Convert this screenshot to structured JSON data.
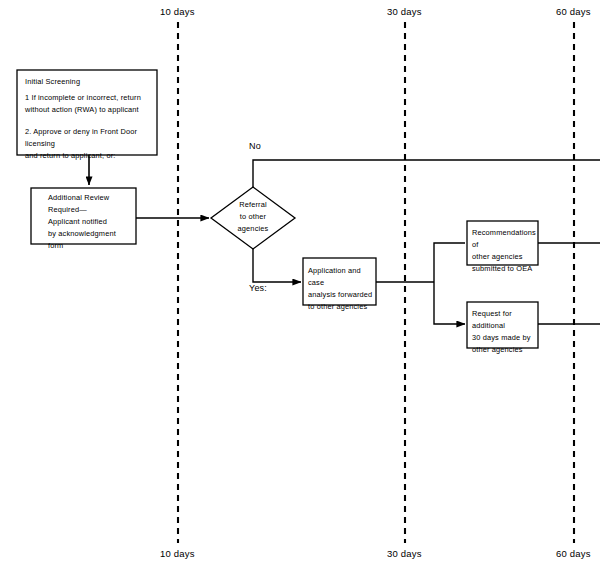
{
  "diagram": {
    "line_color": "#000000",
    "background_color": "#ffffff"
  },
  "timeline": {
    "markers": [
      {
        "label_top": "10 days",
        "label_bottom": "10 days",
        "x": 178
      },
      {
        "label_top": "30 days",
        "label_bottom": "30 days",
        "x": 405
      },
      {
        "label_top": "60 days",
        "label_bottom": "60 days",
        "x": 574
      }
    ]
  },
  "nodes": {
    "initial_screening": {
      "heading": "Initial Screening",
      "item_1": "1  If incomplete or incorrect, return\nwithout action (RWA) to applicant",
      "item_2": "2.  Approve or deny in Front Door licensing\nand return to applicant, or:"
    },
    "additional_review": {
      "text": "Additional Review\nRequired—\nApplicant notified\nby acknowledgment\nform"
    },
    "referral_decision": {
      "text": "Referral\nto other\nagencies"
    },
    "application_forwarded": {
      "text": "Application and case\nanalysis forwarded\nto other agencies"
    },
    "recommendations": {
      "text": "Recommendations of\nother  agencies\nsubmitted to  OEA"
    },
    "request_additional": {
      "text": "Request for additional\n30 days made by\nother  agencies"
    }
  },
  "branch_labels": {
    "no": "No",
    "yes": "Yes:"
  }
}
